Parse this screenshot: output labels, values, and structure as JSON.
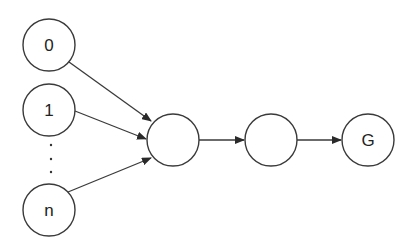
{
  "diagram": {
    "type": "directed-graph",
    "stroke_color": "#3a3a3a",
    "background": "#ffffff",
    "nodes": [
      {
        "id": "n0",
        "label": "0",
        "cx": 49,
        "cy": 45,
        "r": 26
      },
      {
        "id": "n1",
        "label": "1",
        "cx": 49,
        "cy": 110,
        "r": 26
      },
      {
        "id": "nn",
        "label": "n",
        "cx": 49,
        "cy": 210,
        "r": 26
      },
      {
        "id": "h1",
        "label": "",
        "cx": 173,
        "cy": 140,
        "r": 26
      },
      {
        "id": "h2",
        "label": "",
        "cx": 271,
        "cy": 140,
        "r": 26
      },
      {
        "id": "g",
        "label": "G",
        "cx": 368,
        "cy": 140,
        "r": 26
      }
    ],
    "edges": [
      {
        "from": "n0",
        "to": "h1",
        "x1": 69,
        "y1": 62,
        "x2": 151,
        "y2": 121
      },
      {
        "from": "n1",
        "to": "h1",
        "x1": 75,
        "y1": 111,
        "x2": 146,
        "y2": 139
      },
      {
        "from": "nn",
        "to": "h1",
        "x1": 68,
        "y1": 192,
        "x2": 151,
        "y2": 158
      },
      {
        "from": "h1",
        "to": "h2",
        "x1": 199,
        "y1": 140,
        "x2": 244,
        "y2": 140
      },
      {
        "from": "h2",
        "to": "g",
        "x1": 297,
        "y1": 140,
        "x2": 341,
        "y2": 140
      }
    ],
    "ellipsis": {
      "label": "vertical ellipsis between node 1 and node n",
      "dots": [
        {
          "cx": 51,
          "cy": 145
        },
        {
          "cx": 51,
          "cy": 159
        },
        {
          "cx": 51,
          "cy": 172
        }
      ]
    }
  }
}
